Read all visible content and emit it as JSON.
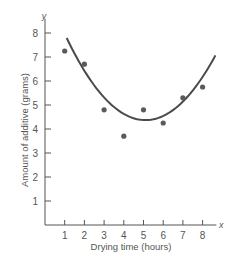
{
  "chart_data": {
    "type": "scatter",
    "title": "",
    "xlabel": "Drying time (hours)",
    "ylabel": "Amount of additive (grams)",
    "x_axis_name": "x",
    "y_axis_name": "y",
    "xlim": [
      0,
      8.7
    ],
    "ylim": [
      0,
      8.6
    ],
    "x_ticks": [
      1,
      2,
      3,
      4,
      5,
      6,
      7,
      8
    ],
    "y_ticks": [
      1,
      2,
      3,
      4,
      5,
      6,
      7,
      8
    ],
    "x_tick_labels": [
      "1",
      "2",
      "3",
      "4",
      "5",
      "6",
      "7",
      "8"
    ],
    "y_tick_labels": [
      "1",
      "2",
      "3",
      "4",
      "5",
      "6",
      "7",
      "8"
    ],
    "grid": false,
    "legend": "none",
    "series": [
      {
        "name": "observations",
        "type": "scatter",
        "x": [
          1,
          2,
          3,
          4,
          5,
          6,
          7,
          8
        ],
        "y": [
          7.25,
          6.7,
          4.8,
          3.7,
          4.8,
          4.25,
          5.3,
          5.75
        ]
      },
      {
        "name": "fitted quadratic",
        "type": "line",
        "equation": "y = 0.214*(x - 5.1)^2 + 4.37",
        "x_range": [
          1.1,
          8.65
        ]
      }
    ],
    "colors": {
      "axis": "#555555",
      "points": "#5a5a5a",
      "curve": "#4a4a4a"
    }
  }
}
